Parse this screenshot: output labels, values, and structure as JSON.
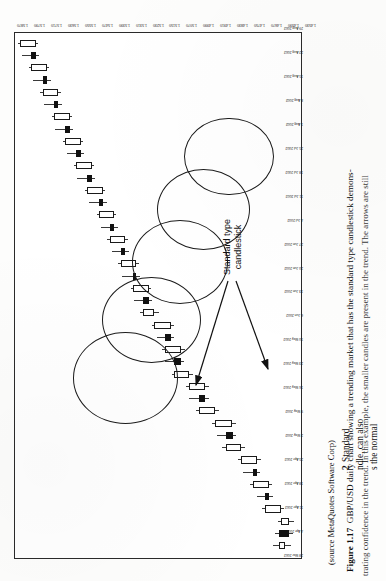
{
  "figure": {
    "ticker_label": "GBPUSD,Daily   1.7148  1.7294  1.6920  1.7234",
    "annotation_label": "Standard type\ncandlestick",
    "caption_source": "(source MetaQuotes Software Corp)",
    "caption_number": "Figure 1.17",
    "caption_text": "GBP/USD daily chart showing a trending market that has the standard type candlestick demons-",
    "caption_line2": "trating confidence in the trend. In this example, the smaller candles are present in the trend. The arrows are still"
  },
  "facing_page": {
    "num": "2",
    "line1": "Standard",
    "line2": "ndle, can also",
    "line3": "s the normal"
  },
  "chart_data": {
    "type": "candlestick",
    "xlabel": "",
    "ylabel": "",
    "grid": false,
    "legend": null,
    "ylim": [
      1.453,
      1.587
    ],
    "price_ticks": [
      "1.5870",
      "1.5790",
      "1.5710",
      "1.5630",
      "1.5550",
      "1.5470",
      "1.5390",
      "1.5310",
      "1.5230",
      "1.5150",
      "1.5070",
      "1.4990",
      "1.4910",
      "1.4830",
      "1.4750",
      "1.4670",
      "1.4590",
      "1.4530"
    ],
    "date_ticks": [
      "28 Mar 2002",
      "4 Apr 2002",
      "11 Apr 2002",
      "18 Apr 2002",
      "25 Apr 2002",
      "2 May 2002",
      "9 May 2002",
      "16 May 2002",
      "23 May 2002",
      "30 May 2002",
      "6 Jun 2002",
      "13 Jun 2002",
      "20 Jun 2002",
      "27 Jun 2002",
      "4 Jul 2002",
      "11 Jul 2002",
      "18 Jul 2002",
      "25 Jul 2002",
      "1 Aug 2002",
      "8 Aug 2002",
      "15 Aug 2002",
      "22 Aug 2002",
      "29 Aug 2002"
    ],
    "candles": [
      {
        "o": 1.4612,
        "h": 1.4668,
        "l": 1.4588,
        "c": 1.464,
        "dir": "up"
      },
      {
        "o": 1.464,
        "h": 1.4662,
        "l": 1.4575,
        "c": 1.4596,
        "dir": "down"
      },
      {
        "o": 1.4596,
        "h": 1.4648,
        "l": 1.457,
        "c": 1.4634,
        "dir": "up"
      },
      {
        "o": 1.4634,
        "h": 1.472,
        "l": 1.462,
        "c": 1.4706,
        "dir": "up"
      },
      {
        "o": 1.4706,
        "h": 1.4742,
        "l": 1.4668,
        "c": 1.469,
        "dir": "down"
      },
      {
        "o": 1.469,
        "h": 1.4775,
        "l": 1.4672,
        "c": 1.4762,
        "dir": "up"
      },
      {
        "o": 1.4762,
        "h": 1.481,
        "l": 1.473,
        "c": 1.4745,
        "dir": "down"
      },
      {
        "o": 1.4745,
        "h": 1.4832,
        "l": 1.4726,
        "c": 1.482,
        "dir": "up"
      },
      {
        "o": 1.482,
        "h": 1.4905,
        "l": 1.48,
        "c": 1.489,
        "dir": "up"
      },
      {
        "o": 1.489,
        "h": 1.493,
        "l": 1.4842,
        "c": 1.4858,
        "dir": "down"
      },
      {
        "o": 1.4858,
        "h": 1.4952,
        "l": 1.484,
        "c": 1.494,
        "dir": "up"
      },
      {
        "o": 1.494,
        "h": 1.503,
        "l": 1.492,
        "c": 1.5012,
        "dir": "up"
      },
      {
        "o": 1.5012,
        "h": 1.506,
        "l": 1.4965,
        "c": 1.4985,
        "dir": "down"
      },
      {
        "o": 1.4985,
        "h": 1.5075,
        "l": 1.4968,
        "c": 1.5062,
        "dir": "up"
      },
      {
        "o": 1.5062,
        "h": 1.514,
        "l": 1.504,
        "c": 1.5128,
        "dir": "up"
      },
      {
        "o": 1.5128,
        "h": 1.5172,
        "l": 1.5082,
        "c": 1.5098,
        "dir": "down"
      },
      {
        "o": 1.5098,
        "h": 1.5185,
        "l": 1.508,
        "c": 1.517,
        "dir": "up"
      },
      {
        "o": 1.517,
        "h": 1.521,
        "l": 1.513,
        "c": 1.5145,
        "dir": "down"
      },
      {
        "o": 1.5145,
        "h": 1.5232,
        "l": 1.5128,
        "c": 1.5222,
        "dir": "up"
      },
      {
        "o": 1.5222,
        "h": 1.529,
        "l": 1.52,
        "c": 1.5276,
        "dir": "up"
      },
      {
        "o": 1.5276,
        "h": 1.5318,
        "l": 1.5232,
        "c": 1.5248,
        "dir": "down"
      },
      {
        "o": 1.5248,
        "h": 1.533,
        "l": 1.5238,
        "c": 1.532,
        "dir": "up"
      },
      {
        "o": 1.532,
        "h": 1.5372,
        "l": 1.529,
        "c": 1.5305,
        "dir": "down"
      },
      {
        "o": 1.5305,
        "h": 1.539,
        "l": 1.5292,
        "c": 1.5378,
        "dir": "up"
      },
      {
        "o": 1.5378,
        "h": 1.542,
        "l": 1.534,
        "c": 1.5356,
        "dir": "down"
      },
      {
        "o": 1.5356,
        "h": 1.544,
        "l": 1.5345,
        "c": 1.543,
        "dir": "up"
      },
      {
        "o": 1.543,
        "h": 1.5472,
        "l": 1.5392,
        "c": 1.5408,
        "dir": "down"
      },
      {
        "o": 1.5408,
        "h": 1.549,
        "l": 1.5398,
        "c": 1.548,
        "dir": "up"
      },
      {
        "o": 1.548,
        "h": 1.5525,
        "l": 1.5444,
        "c": 1.546,
        "dir": "down"
      },
      {
        "o": 1.546,
        "h": 1.5545,
        "l": 1.545,
        "c": 1.5535,
        "dir": "up"
      },
      {
        "o": 1.5535,
        "h": 1.558,
        "l": 1.5498,
        "c": 1.5512,
        "dir": "down"
      },
      {
        "o": 1.5512,
        "h": 1.5596,
        "l": 1.5502,
        "c": 1.5586,
        "dir": "up"
      },
      {
        "o": 1.5586,
        "h": 1.563,
        "l": 1.5548,
        "c": 1.5564,
        "dir": "down"
      },
      {
        "o": 1.5564,
        "h": 1.5648,
        "l": 1.5554,
        "c": 1.5638,
        "dir": "up"
      },
      {
        "o": 1.5638,
        "h": 1.5682,
        "l": 1.56,
        "c": 1.5616,
        "dir": "down"
      },
      {
        "o": 1.5616,
        "h": 1.57,
        "l": 1.5606,
        "c": 1.569,
        "dir": "up"
      },
      {
        "o": 1.569,
        "h": 1.5735,
        "l": 1.5652,
        "c": 1.5668,
        "dir": "down"
      },
      {
        "o": 1.5668,
        "h": 1.5752,
        "l": 1.5658,
        "c": 1.5742,
        "dir": "up"
      },
      {
        "o": 1.5742,
        "h": 1.5788,
        "l": 1.5704,
        "c": 1.572,
        "dir": "down"
      },
      {
        "o": 1.572,
        "h": 1.5804,
        "l": 1.571,
        "c": 1.5794,
        "dir": "up"
      },
      {
        "o": 1.5794,
        "h": 1.5838,
        "l": 1.5756,
        "c": 1.5772,
        "dir": "down"
      },
      {
        "o": 1.5772,
        "h": 1.5856,
        "l": 1.5762,
        "c": 1.5846,
        "dir": "up"
      }
    ],
    "ellipses": [
      {
        "cx": 0.34,
        "cy": 0.38,
        "r": 0.085
      },
      {
        "cx": 0.45,
        "cy": 0.47,
        "r": 0.08
      },
      {
        "cx": 0.56,
        "cy": 0.57,
        "r": 0.078
      },
      {
        "cx": 0.66,
        "cy": 0.65,
        "r": 0.075
      },
      {
        "cx": 0.76,
        "cy": 0.74,
        "r": 0.072
      }
    ]
  }
}
